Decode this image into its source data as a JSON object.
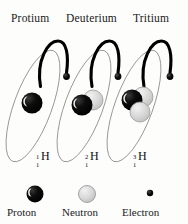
{
  "figure": {
    "title_row": {
      "protium": "Protium",
      "deuterium": "Deuterium",
      "tritium": "Tritium"
    },
    "background_color": "#fdfdfc",
    "ink_color": "#1a1a1a"
  },
  "atoms": [
    {
      "name": "protium",
      "heading": "Protium",
      "symbol": {
        "mass_number": "1",
        "atomic_number": "1",
        "element": "H"
      },
      "protons": 1,
      "neutrons": 0,
      "electrons": 1,
      "nucleus": [
        {
          "particle": "proton",
          "cx": 32,
          "cy": 103,
          "r": 10.5,
          "color": "#000000"
        }
      ],
      "electron": {
        "cx": 66.5,
        "cy": 76.5,
        "r": 3.4,
        "color": "#000000"
      },
      "orbit": {
        "cx": 33,
        "cy": 106,
        "rx": 19,
        "ry": 59,
        "rotation": 20,
        "color": "#6f6f6f"
      },
      "arc_color": "#000000"
    },
    {
      "name": "deuterium",
      "heading": "Deuterium",
      "symbol": {
        "mass_number": "2",
        "atomic_number": "1",
        "element": "H"
      },
      "protons": 1,
      "neutrons": 1,
      "electrons": 1,
      "nucleus": [
        {
          "particle": "neutron",
          "cx": 93,
          "cy": 100,
          "r": 10,
          "color": "#d2d2d2"
        },
        {
          "particle": "proton",
          "cx": 82,
          "cy": 105,
          "r": 10.5,
          "color": "#000000"
        }
      ],
      "electron": {
        "cx": 118,
        "cy": 76.5,
        "r": 3.4,
        "color": "#000000"
      },
      "orbit": {
        "cx": 84,
        "cy": 106,
        "rx": 19,
        "ry": 59,
        "rotation": 20,
        "color": "#6f6f6f"
      },
      "arc_color": "#000000"
    },
    {
      "name": "tritium",
      "heading": "Tritium",
      "symbol": {
        "mass_number": "3",
        "atomic_number": "1",
        "element": "H"
      },
      "protons": 1,
      "neutrons": 2,
      "electrons": 1,
      "nucleus": [
        {
          "particle": "neutron",
          "cx": 143,
          "cy": 97,
          "r": 10,
          "color": "#d2d2d2"
        },
        {
          "particle": "proton",
          "cx": 132,
          "cy": 100,
          "r": 10.5,
          "color": "#000000"
        },
        {
          "particle": "neutron",
          "cx": 140,
          "cy": 112,
          "r": 10,
          "color": "#d2d2d2"
        }
      ],
      "electron": {
        "cx": 170,
        "cy": 76.5,
        "r": 3.4,
        "color": "#000000"
      },
      "orbit": {
        "cx": 134,
        "cy": 106,
        "rx": 19,
        "ry": 59,
        "rotation": 20,
        "color": "#6f6f6f"
      },
      "arc_color": "#000000"
    }
  ],
  "legend": {
    "items": [
      {
        "key": "proton",
        "label": "Proton",
        "shape": "sphere",
        "color": "#000000",
        "radius": 8.5,
        "cx": 35,
        "cy": 194
      },
      {
        "key": "neutron",
        "label": "Neutron",
        "shape": "sphere",
        "color": "#d2d2d2",
        "radius": 8.5,
        "cx": 87,
        "cy": 194
      },
      {
        "key": "electron",
        "label": "Electron",
        "shape": "dot",
        "color": "#000000",
        "radius": 3.2,
        "cx": 150,
        "cy": 193
      }
    ]
  }
}
